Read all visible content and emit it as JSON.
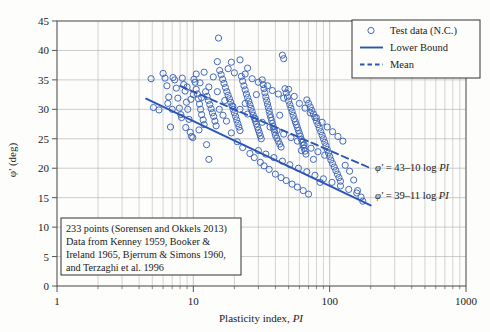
{
  "chart_data": {
    "type": "scatter",
    "title": "",
    "xlabel": "Plasticity index, PI",
    "ylabel": "φ' (deg)",
    "xscale": "log",
    "xlim": [
      1,
      1000
    ],
    "ylim": [
      0,
      45
    ],
    "ytick_labels": [
      "0",
      "5",
      "10",
      "15",
      "20",
      "25",
      "30",
      "35",
      "40",
      "45"
    ],
    "ytick_values": [
      0,
      5,
      10,
      15,
      20,
      25,
      30,
      35,
      40,
      45
    ],
    "xtick_labels": [
      "1",
      "10",
      "100",
      "1000"
    ],
    "xtick_values": [
      1,
      10,
      100,
      1000
    ],
    "grid": "major and minor log gridlines",
    "legend_position": "top-right",
    "series": [
      {
        "name": "Test data (N.C.)",
        "type": "scatter",
        "marker": "open-circle",
        "color": "#3b63b8",
        "n_points": 233,
        "points": [
          [
            4.9,
            35.2
          ],
          [
            5.1,
            30.3
          ],
          [
            5.6,
            29.9
          ],
          [
            6.0,
            36.1
          ],
          [
            6.2,
            35.3
          ],
          [
            6.4,
            34.0
          ],
          [
            6.6,
            32.1
          ],
          [
            6.8,
            27.0
          ],
          [
            7.1,
            35.4
          ],
          [
            7.3,
            35.0
          ],
          [
            7.5,
            33.6
          ],
          [
            7.7,
            31.9
          ],
          [
            7.9,
            30.2
          ],
          [
            8.1,
            29.1
          ],
          [
            8.3,
            35.3
          ],
          [
            8.5,
            34.2
          ],
          [
            8.7,
            33.1
          ],
          [
            8.9,
            31.2
          ],
          [
            9.1,
            30.0
          ],
          [
            9.3,
            28.3
          ],
          [
            9.5,
            26.1
          ],
          [
            9.7,
            25.4
          ],
          [
            9.9,
            25.2
          ],
          [
            10.1,
            35.1
          ],
          [
            10.3,
            34.6
          ],
          [
            10.5,
            33.4
          ],
          [
            10.7,
            32.6
          ],
          [
            10.9,
            31.8
          ],
          [
            11.1,
            30.9
          ],
          [
            11.3,
            30.0
          ],
          [
            11.5,
            29.1
          ],
          [
            11.8,
            28.2
          ],
          [
            12.0,
            27.4
          ],
          [
            12.3,
            33.0
          ],
          [
            12.6,
            32.2
          ],
          [
            12.9,
            31.5
          ],
          [
            13.2,
            30.8
          ],
          [
            13.5,
            30.1
          ],
          [
            13.8,
            29.4
          ],
          [
            14.1,
            28.8
          ],
          [
            14.4,
            28.0
          ],
          [
            14.7,
            27.2
          ],
          [
            15.0,
            38.1
          ],
          [
            15.3,
            42.1
          ],
          [
            15.6,
            36.6
          ],
          [
            16.0,
            35.9
          ],
          [
            16.4,
            35.1
          ],
          [
            16.8,
            34.4
          ],
          [
            17.2,
            33.7
          ],
          [
            17.6,
            33.0
          ],
          [
            18.0,
            32.4
          ],
          [
            18.4,
            31.8
          ],
          [
            18.8,
            31.2
          ],
          [
            19.2,
            30.6
          ],
          [
            19.6,
            30.0
          ],
          [
            20.0,
            29.4
          ],
          [
            20.4,
            28.8
          ],
          [
            20.8,
            28.2
          ],
          [
            21.2,
            27.6
          ],
          [
            21.6,
            27.0
          ],
          [
            22.0,
            26.4
          ],
          [
            22.5,
            35.6
          ],
          [
            23.0,
            34.8
          ],
          [
            23.5,
            34.0
          ],
          [
            24.0,
            33.3
          ],
          [
            24.5,
            32.6
          ],
          [
            25.0,
            32.0
          ],
          [
            25.5,
            31.4
          ],
          [
            26.0,
            30.8
          ],
          [
            26.5,
            30.2
          ],
          [
            27.0,
            29.6
          ],
          [
            27.5,
            29.0
          ],
          [
            28.0,
            28.5
          ],
          [
            28.5,
            28.0
          ],
          [
            29.0,
            27.5
          ],
          [
            29.5,
            27.0
          ],
          [
            30.0,
            26.5
          ],
          [
            30.5,
            26.0
          ],
          [
            31.0,
            25.5
          ],
          [
            31.5,
            25.0
          ],
          [
            32.0,
            35.0
          ],
          [
            32.5,
            34.2
          ],
          [
            33.0,
            33.5
          ],
          [
            33.5,
            32.8
          ],
          [
            34.0,
            32.1
          ],
          [
            34.5,
            31.5
          ],
          [
            35.0,
            30.9
          ],
          [
            35.5,
            30.3
          ],
          [
            36.0,
            29.7
          ],
          [
            36.5,
            29.1
          ],
          [
            37.0,
            28.6
          ],
          [
            37.5,
            28.1
          ],
          [
            38.0,
            27.6
          ],
          [
            38.5,
            27.1
          ],
          [
            39.0,
            26.6
          ],
          [
            39.5,
            26.1
          ],
          [
            40.0,
            25.6
          ],
          [
            41.0,
            25.1
          ],
          [
            42.0,
            24.6
          ],
          [
            43.0,
            24.1
          ],
          [
            44.0,
            23.6
          ],
          [
            45.0,
            39.2
          ],
          [
            46.0,
            38.6
          ],
          [
            47.0,
            33.5
          ],
          [
            48.0,
            32.8
          ],
          [
            49.0,
            32.1
          ],
          [
            50.0,
            31.4
          ],
          [
            51.0,
            30.8
          ],
          [
            52.0,
            30.2
          ],
          [
            53.0,
            29.6
          ],
          [
            54.0,
            29.0
          ],
          [
            55.0,
            28.4
          ],
          [
            56.0,
            27.9
          ],
          [
            57.0,
            27.4
          ],
          [
            58.0,
            26.9
          ],
          [
            59.0,
            26.4
          ],
          [
            60.0,
            25.9
          ],
          [
            61.0,
            25.4
          ],
          [
            62.0,
            24.9
          ],
          [
            63.0,
            24.4
          ],
          [
            64.0,
            23.9
          ],
          [
            65.0,
            23.4
          ],
          [
            66.0,
            22.9
          ],
          [
            67.0,
            22.4
          ],
          [
            68.0,
            31.6
          ],
          [
            70.0,
            31.0
          ],
          [
            72.0,
            30.4
          ],
          [
            74.0,
            29.8
          ],
          [
            76.0,
            29.2
          ],
          [
            78.0,
            28.6
          ],
          [
            80.0,
            28.0
          ],
          [
            82.0,
            27.4
          ],
          [
            84.0,
            26.8
          ],
          [
            86.0,
            26.2
          ],
          [
            88.0,
            25.6
          ],
          [
            90.0,
            25.0
          ],
          [
            92.0,
            24.4
          ],
          [
            94.0,
            23.8
          ],
          [
            96.0,
            23.2
          ],
          [
            98.0,
            22.6
          ],
          [
            100.0,
            22.0
          ],
          [
            102.0,
            21.4
          ],
          [
            105.0,
            20.8
          ],
          [
            108.0,
            20.2
          ],
          [
            111.0,
            19.6
          ],
          [
            114.0,
            19.0
          ],
          [
            117.0,
            18.4
          ],
          [
            120.0,
            17.8
          ],
          [
            85.0,
            17.6
          ],
          [
            130.0,
            20.5
          ],
          [
            140.0,
            19.5
          ],
          [
            150.0,
            18.0
          ],
          [
            160.0,
            16.2
          ],
          [
            170.0,
            15.1
          ],
          [
            175.0,
            14.4
          ],
          [
            8.2,
            28.6
          ],
          [
            8.8,
            26.9
          ],
          [
            11.0,
            26.5
          ],
          [
            12.5,
            24.0
          ],
          [
            13.0,
            21.5
          ],
          [
            14.0,
            35.5
          ],
          [
            15.5,
            30.0
          ],
          [
            16.5,
            29.0
          ],
          [
            17.5,
            28.0
          ],
          [
            19.0,
            26.0
          ],
          [
            21.0,
            24.5
          ],
          [
            23.0,
            23.5
          ],
          [
            26.0,
            22.5
          ],
          [
            28.0,
            21.8
          ],
          [
            31.0,
            21.0
          ],
          [
            33.0,
            20.4
          ],
          [
            36.0,
            19.8
          ],
          [
            40.0,
            19.0
          ],
          [
            44.0,
            18.4
          ],
          [
            48.0,
            17.9
          ],
          [
            53.0,
            17.3
          ],
          [
            58.0,
            16.8
          ],
          [
            64.0,
            16.2
          ],
          [
            70.0,
            15.6
          ],
          [
            9.0,
            33.8
          ],
          [
            10.0,
            32.5
          ],
          [
            11.5,
            32.0
          ],
          [
            13.0,
            33.8
          ],
          [
            15.0,
            33.0
          ],
          [
            17.0,
            31.5
          ],
          [
            19.5,
            30.5
          ],
          [
            22.0,
            30.0
          ],
          [
            25.0,
            29.2
          ],
          [
            28.5,
            28.4
          ],
          [
            32.0,
            27.8
          ],
          [
            36.5,
            27.0
          ],
          [
            41.0,
            26.4
          ],
          [
            46.0,
            25.8
          ],
          [
            52.0,
            25.2
          ],
          [
            58.0,
            24.6
          ],
          [
            65.0,
            24.0
          ],
          [
            73.0,
            23.4
          ],
          [
            82.0,
            22.8
          ],
          [
            92.0,
            22.2
          ],
          [
            18.0,
            36.9
          ],
          [
            20.0,
            36.2
          ],
          [
            24.0,
            36.0
          ],
          [
            27.0,
            35.2
          ],
          [
            30.0,
            34.6
          ],
          [
            19.0,
            38.0
          ],
          [
            22.0,
            38.4
          ],
          [
            25.0,
            37.0
          ],
          [
            12.0,
            36.3
          ],
          [
            10.5,
            36.0
          ],
          [
            35.0,
            34.0
          ],
          [
            38.0,
            33.2
          ],
          [
            42.0,
            32.6
          ],
          [
            46.0,
            31.9
          ],
          [
            50.0,
            33.4
          ],
          [
            55.0,
            32.2
          ],
          [
            60.0,
            31.0
          ],
          [
            66.0,
            30.2
          ],
          [
            72.0,
            29.4
          ],
          [
            80.0,
            28.6
          ],
          [
            88.0,
            27.8
          ],
          [
            96.0,
            27.0
          ],
          [
            105.0,
            26.2
          ],
          [
            115.0,
            25.4
          ],
          [
            125.0,
            24.6
          ],
          [
            30.0,
            23.0
          ],
          [
            34.0,
            22.4
          ],
          [
            39.0,
            21.8
          ],
          [
            45.0,
            21.2
          ],
          [
            51.0,
            20.6
          ],
          [
            59.0,
            20.0
          ],
          [
            68.0,
            19.4
          ],
          [
            78.0,
            18.8
          ],
          [
            90.0,
            18.2
          ],
          [
            104.0,
            17.6
          ],
          [
            120.0,
            17.0
          ],
          [
            138.0,
            16.4
          ],
          [
            158.0,
            15.8
          ],
          [
            6.5,
            31.0
          ],
          [
            7.0,
            30.0
          ],
          [
            9.6,
            31.7
          ],
          [
            11.2,
            34.5
          ],
          [
            24.0,
            31.0
          ],
          [
            29.0,
            32.5
          ],
          [
            43.0,
            29.0
          ],
          [
            62.0,
            23.0
          ],
          [
            76.0,
            21.5
          ]
        ]
      },
      {
        "name": "Lower Bound",
        "type": "line",
        "style": "solid",
        "color": "#2a55b5",
        "equation": "φ' = 39–11 log PI",
        "intercept": 39,
        "slope": -11,
        "x_range": [
          4.5,
          200
        ]
      },
      {
        "name": "Mean",
        "type": "line",
        "style": "dashed",
        "color": "#2a55b5",
        "equation": "φ' = 43–10 log PI",
        "intercept": 43,
        "slope": -10,
        "x_range": [
          8,
          200
        ]
      }
    ],
    "annotations": [
      {
        "name": "mean-equation",
        "text_parts": [
          "φ'",
          " = 43–10 log ",
          "PI"
        ]
      },
      {
        "name": "lower-bound-equation",
        "text_parts": [
          "φ'",
          " = 39–11 log ",
          "PI"
        ]
      }
    ],
    "note_box": {
      "lines": [
        "233 points (Sorensen and Okkels 2013)",
        "Data from Kenney 1959, Booker &",
        "Ireland 1965, Bjerrum & Simons 1960,",
        "and Terzaghi et al. 1996"
      ]
    }
  },
  "legend": {
    "items": [
      {
        "label": "Test data (N.C.)",
        "marker": "open-circle"
      },
      {
        "label": "Lower Bound",
        "marker": "solid-line"
      },
      {
        "label": "Mean",
        "marker": "dashed-line"
      }
    ]
  },
  "axes": {
    "x_title_parts": [
      "Plasticity index, ",
      "PI"
    ],
    "y_title": "φ' (deg)"
  },
  "colors": {
    "data": "#3b63b8",
    "line": "#2a55b5",
    "grid": "#b9b9b9",
    "frame": "#555555",
    "background": "#fdfdfb"
  }
}
